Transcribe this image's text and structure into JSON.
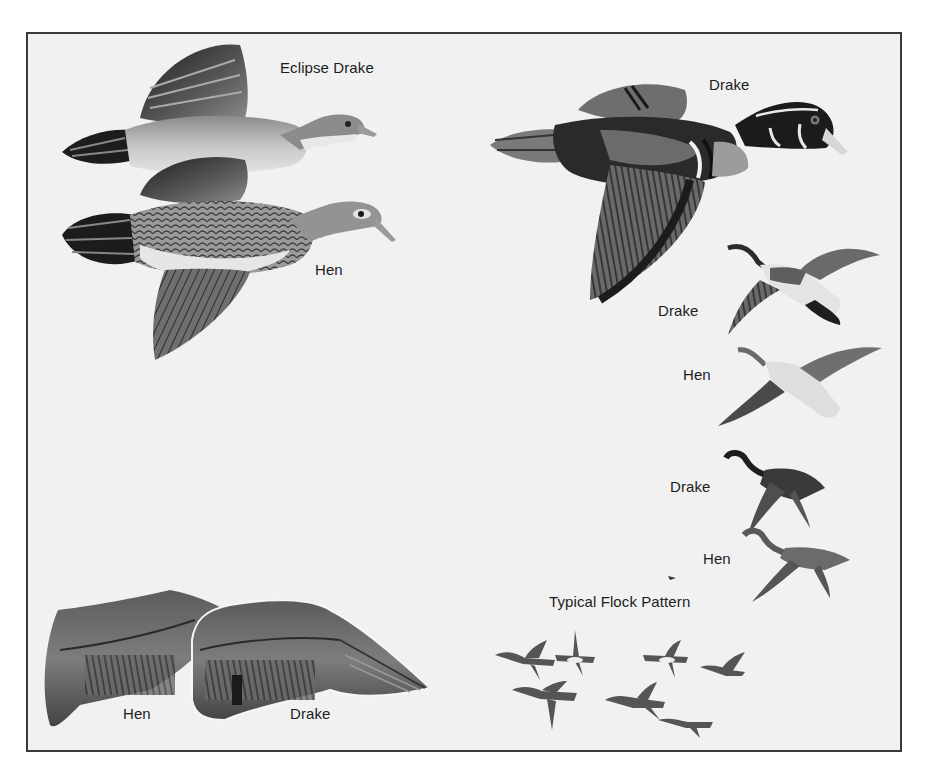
{
  "plate": {
    "background_color": "#f1f1f1",
    "border_color": "#3a3a3a",
    "ink_color": "#1c1c1c"
  },
  "labels": {
    "eclipse_drake": "Eclipse Drake",
    "hen_large": "Hen",
    "drake_large": "Drake",
    "drake_small_1": "Drake",
    "hen_small_1": "Hen",
    "drake_small_2": "Drake",
    "hen_small_2": "Hen",
    "flock": "Typical Flock Pattern",
    "wing_hen": "Hen",
    "wing_drake": "Drake"
  },
  "illustrations": [
    {
      "id": "eclipse-drake",
      "label_key": "eclipse_drake",
      "type": "duck-flying-side"
    },
    {
      "id": "hen-large",
      "label_key": "hen_large",
      "type": "duck-flying-side"
    },
    {
      "id": "drake-large",
      "label_key": "drake_large",
      "type": "duck-flying-side"
    },
    {
      "id": "drake-overhead",
      "label_key": "drake_small_1",
      "type": "duck-flying-overhead"
    },
    {
      "id": "hen-overhead",
      "label_key": "hen_small_1",
      "type": "duck-flying-overhead"
    },
    {
      "id": "drake-small-side",
      "label_key": "drake_small_2",
      "type": "duck-flying-side-small"
    },
    {
      "id": "hen-small-side",
      "label_key": "hen_small_2",
      "type": "duck-flying-side-small"
    },
    {
      "id": "flock",
      "label_key": "flock",
      "type": "flock",
      "count": 7
    },
    {
      "id": "wing-hen",
      "label_key": "wing_hen",
      "type": "wing"
    },
    {
      "id": "wing-drake",
      "label_key": "wing_drake",
      "type": "wing"
    }
  ]
}
